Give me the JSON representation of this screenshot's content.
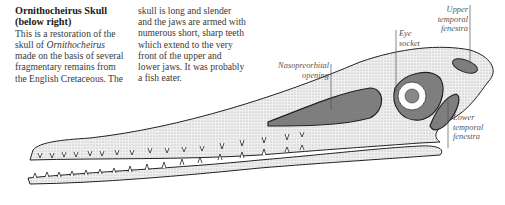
{
  "article": {
    "heading_line1": "Ornithocheirus Skull",
    "heading_line2": "(below right)",
    "col1_lines": [
      "This is a restoration of the",
      "skull of ",
      "made on the basis of several",
      "fragmentary remains from",
      "the English Cretaceous. The"
    ],
    "col1_italic": "Ornithocheirus",
    "col2_lines": [
      "skull is long and slender",
      "and the jaws are armed with",
      "numerous short, sharp teeth",
      "which extend to the very",
      "front of the upper and",
      "lower jaws. It was probably",
      "a fish eater."
    ]
  },
  "labels": {
    "nasopreorbital_1": "Nasopreorbital",
    "nasopreorbital_2": "opening",
    "eye_1": "Eye",
    "eye_2": "socket",
    "upper_1": "Upper",
    "upper_2": "temporal",
    "upper_3": "fenestra",
    "lower_1": "Lower",
    "lower_2": "temporal",
    "lower_3": "fenestra"
  }
}
